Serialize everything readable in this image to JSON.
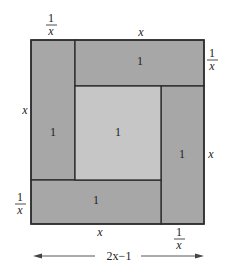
{
  "diagram": {
    "type": "square-dissection",
    "colors": {
      "background": "#ffffff",
      "rect_fill": "#a7a7a7",
      "center_fill": "#c6c6c6",
      "stroke": "#2a2a2a"
    },
    "regions": [
      {
        "id": "left-rect",
        "area_label": "1"
      },
      {
        "id": "top-rect",
        "area_label": "1"
      },
      {
        "id": "center-square",
        "area_label": "1"
      },
      {
        "id": "right-rect",
        "area_label": "1"
      },
      {
        "id": "bottom-rect",
        "area_label": "1"
      }
    ],
    "labels": {
      "top_left_width": {
        "num": "1",
        "den": "x"
      },
      "top_width": "x",
      "right_top_height": {
        "num": "1",
        "den": "x"
      },
      "left_height": "x",
      "right_height": "x",
      "left_bottom_height": {
        "num": "1",
        "den": "x"
      },
      "bottom_width": "x",
      "bottom_right_width": {
        "num": "1",
        "den": "x"
      },
      "total_width": "2x−1"
    }
  }
}
